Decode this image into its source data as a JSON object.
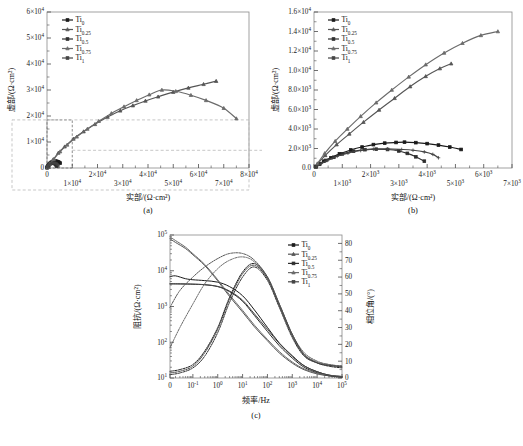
{
  "figure": {
    "panels": [
      {
        "id": "a",
        "caption": "(a)"
      },
      {
        "id": "b",
        "caption": "(b)"
      },
      {
        "id": "c",
        "caption": "(c)"
      }
    ]
  },
  "legend": {
    "entries": [
      {
        "base": "Ti",
        "sub": "0",
        "color": "#1a1a1a"
      },
      {
        "base": "Ti",
        "sub": "0.25",
        "color": "#555555"
      },
      {
        "base": "Ti",
        "sub": "0.5",
        "color": "#2e2e2e"
      },
      {
        "base": "Ti",
        "sub": "0.75",
        "color": "#6b6b6b"
      },
      {
        "base": "Ti",
        "sub": "1",
        "color": "#444444"
      }
    ]
  },
  "chart_data": [
    {
      "type": "scatter",
      "panel": "a",
      "title": "",
      "caption": "(a)",
      "xlabel": "实部/(Ω·cm²)",
      "ylabel": "虚部/(Ω·cm²)",
      "xlim": [
        0,
        80000
      ],
      "ylim": [
        0,
        60000
      ],
      "xticklabels": [
        "0",
        "1×10⁴",
        "2×10⁴",
        "3×10⁴",
        "4×10⁴",
        "5×10⁴",
        "6×10⁴",
        "7×10⁴",
        "8×10⁴"
      ],
      "yticklabels": [
        "0",
        "1×10⁴",
        "2×10⁴",
        "3×10⁴",
        "4×10⁴",
        "5×10⁴",
        "6×10⁴"
      ],
      "grid": false,
      "legend_position": "top-left",
      "zoom_box": {
        "x0": 0,
        "x1": 10000,
        "y0": 0,
        "y1": 18500,
        "note": "dashed inset box magnified in panel (b)"
      },
      "series": [
        {
          "name": "Ti0",
          "color": "#1a1a1a",
          "marker": "square",
          "x": [
            60,
            180,
            350,
            600,
            900,
            1300,
            1700,
            2100,
            2500,
            2900,
            3200,
            3600,
            4000,
            4400,
            4800,
            5200
          ],
          "y": [
            120,
            380,
            700,
            1050,
            1450,
            1850,
            2150,
            2400,
            2550,
            2620,
            2650,
            2600,
            2500,
            2350,
            2150,
            1900
          ]
        },
        {
          "name": "Ti0.25",
          "color": "#555555",
          "marker": "tri",
          "x": [
            200,
            900,
            2400,
            4500,
            7000,
            10500,
            14500,
            19000,
            24000,
            29000,
            34000,
            39000,
            44000,
            50000,
            56000,
            62000,
            67000
          ],
          "y": [
            300,
            1300,
            3200,
            5800,
            8200,
            11200,
            14000,
            16800,
            19600,
            22000,
            24000,
            25800,
            27400,
            29200,
            30800,
            32200,
            33400
          ]
        },
        {
          "name": "Ti0.5",
          "color": "#2e2e2e",
          "marker": "square",
          "x": [
            80,
            200,
            420,
            700,
            1000,
            1400,
            1800,
            2200,
            2600,
            3000,
            3300,
            3600,
            3900
          ],
          "y": [
            150,
            420,
            780,
            1100,
            1450,
            1720,
            1880,
            1930,
            1900,
            1750,
            1500,
            1150,
            700
          ]
        },
        {
          "name": "Ti0.75",
          "color": "#6b6b6b",
          "marker": "tri",
          "x": [
            250,
            1100,
            2800,
            5200,
            8000,
            11800,
            16000,
            20500,
            25500,
            30500,
            35500,
            40500,
            45500,
            51000,
            57000,
            63000,
            70000,
            75000
          ],
          "y": [
            350,
            1500,
            3500,
            6300,
            8900,
            12000,
            15000,
            18000,
            21000,
            23600,
            26000,
            28200,
            30000,
            29500,
            28000,
            26000,
            23000,
            19000
          ]
        },
        {
          "name": "Ti1",
          "color": "#444444",
          "marker": "plus",
          "x": [
            90,
            260,
            500,
            820,
            1200,
            1650,
            2100,
            2600,
            3100,
            3500,
            3900,
            4200,
            4400
          ],
          "y": [
            160,
            450,
            830,
            1200,
            1520,
            1790,
            1930,
            1960,
            1900,
            1820,
            1650,
            1400,
            1050
          ]
        }
      ]
    },
    {
      "type": "scatter",
      "panel": "b",
      "title": "",
      "caption": "(b)",
      "xlabel": "实部/(Ω·cm²)",
      "ylabel": "虚部/(Ω·cm²)",
      "xlim": [
        0,
        7000
      ],
      "ylim": [
        0,
        16000
      ],
      "xticklabels": [
        "0",
        "1×10³",
        "2×10³",
        "3×10³",
        "4×10³",
        "5×10³",
        "6×10³",
        "7×10³"
      ],
      "yticklabels": [
        "0.0",
        "2.0×10³",
        "4.0×10³",
        "6.0×10³",
        "8.0×10³",
        "1.0×10⁴",
        "1.2×10⁴",
        "1.4×10⁴",
        "1.6×10⁴"
      ],
      "grid": false,
      "legend_position": "top-left",
      "series": [
        {
          "name": "Ti0",
          "color": "#1a1a1a",
          "marker": "square",
          "x": [
            60,
            180,
            350,
            600,
            900,
            1300,
            1700,
            2100,
            2500,
            2900,
            3200,
            3600,
            4000,
            4400,
            4800,
            5200
          ],
          "y": [
            120,
            380,
            700,
            1050,
            1450,
            1850,
            2150,
            2400,
            2550,
            2620,
            2650,
            2600,
            2500,
            2350,
            2150,
            1900
          ]
        },
        {
          "name": "Ti0.25",
          "color": "#555555",
          "marker": "tri",
          "x": [
            120,
            400,
            800,
            1250,
            1750,
            2300,
            2850,
            3400,
            3950,
            4450,
            4850
          ],
          "y": [
            400,
            1300,
            2400,
            3500,
            4700,
            5950,
            7150,
            8350,
            9400,
            10200,
            10700
          ]
        },
        {
          "name": "Ti0.5",
          "color": "#2e2e2e",
          "marker": "square",
          "x": [
            80,
            200,
            420,
            700,
            1000,
            1400,
            1800,
            2200,
            2600,
            3000,
            3300,
            3600,
            3900
          ],
          "y": [
            150,
            420,
            780,
            1100,
            1450,
            1720,
            1880,
            1930,
            1900,
            1750,
            1500,
            1150,
            700
          ]
        },
        {
          "name": "Ti0.75",
          "color": "#6b6b6b",
          "marker": "tri",
          "x": [
            120,
            380,
            750,
            1180,
            1650,
            2200,
            2750,
            3350,
            3950,
            4600,
            5250,
            5900,
            6500
          ],
          "y": [
            450,
            1500,
            2750,
            4000,
            5300,
            6700,
            8000,
            9350,
            10600,
            11800,
            12800,
            13600,
            14000
          ]
        },
        {
          "name": "Ti1",
          "color": "#444444",
          "marker": "plus",
          "x": [
            90,
            260,
            500,
            820,
            1200,
            1650,
            2100,
            2600,
            3100,
            3500,
            3900,
            4200,
            4400
          ],
          "y": [
            160,
            450,
            830,
            1200,
            1520,
            1790,
            1930,
            1960,
            1900,
            1820,
            1650,
            1400,
            1050
          ]
        }
      ]
    },
    {
      "type": "line",
      "panel": "c",
      "title": "",
      "caption": "(c)",
      "xlabel": "频率/Hz",
      "ylabel": "阻抗/(Ω·cm²)",
      "y2label": "相位角/(°)",
      "xscale": "log",
      "yscale": "log",
      "xlim": [
        0.01,
        100000
      ],
      "ylim": [
        10,
        100000
      ],
      "y2lim": [
        0,
        85
      ],
      "xticklabels": [
        "0",
        "10⁻¹",
        "10⁰",
        "10¹",
        "10²",
        "10³",
        "10⁴",
        "10⁵"
      ],
      "yticklabels": [
        "10¹",
        "10²",
        "10³",
        "10⁴",
        "10⁵"
      ],
      "y2ticklabels": [
        "0",
        "10",
        "20",
        "30",
        "40",
        "50",
        "60",
        "70",
        "80"
      ],
      "grid": false,
      "legend_position": "top-right",
      "modulus_series": [
        {
          "name": "Ti0",
          "color": "#1a1a1a",
          "x": [
            0.01,
            0.02,
            0.05,
            0.1,
            0.3,
            1,
            3,
            10,
            30,
            100,
            300,
            1000,
            3000,
            10000,
            30000,
            100000
          ],
          "y": [
            6800,
            7200,
            6000,
            5600,
            5300,
            4800,
            3600,
            2000,
            800,
            260,
            95,
            42,
            22,
            15,
            12,
            11
          ]
        },
        {
          "name": "Ti0.25",
          "color": "#555555",
          "x": [
            0.01,
            0.02,
            0.05,
            0.1,
            0.3,
            1,
            3,
            10,
            30,
            100,
            300,
            1000,
            3000,
            10000,
            30000,
            100000
          ],
          "y": [
            78000,
            62000,
            42000,
            28000,
            14000,
            5200,
            1900,
            700,
            270,
            110,
            50,
            26,
            17,
            13,
            11.5,
            11
          ]
        },
        {
          "name": "Ti0.5",
          "color": "#2e2e2e",
          "x": [
            0.01,
            0.02,
            0.05,
            0.1,
            0.3,
            1,
            3,
            10,
            30,
            100,
            300,
            1000,
            3000,
            10000,
            30000,
            100000
          ],
          "y": [
            4300,
            4300,
            4250,
            4200,
            4050,
            3600,
            2600,
            1400,
            560,
            200,
            80,
            36,
            20,
            14,
            11.5,
            10.5
          ]
        },
        {
          "name": "Ti0.75",
          "color": "#6b6b6b",
          "x": [
            0.01,
            0.02,
            0.05,
            0.1,
            0.3,
            1,
            3,
            10,
            30,
            100,
            300,
            1000,
            3000,
            10000,
            30000,
            100000
          ],
          "y": [
            88000,
            70000,
            46000,
            30000,
            15000,
            5600,
            2100,
            780,
            300,
            120,
            55,
            28,
            18,
            13.5,
            12,
            11
          ]
        },
        {
          "name": "Ti1",
          "color": "#444444",
          "x": [
            0.01,
            0.02,
            0.05,
            0.1,
            0.3,
            1,
            3,
            10,
            30,
            100,
            300,
            1000,
            3000,
            10000,
            30000,
            100000
          ],
          "y": [
            4300,
            4300,
            4280,
            4230,
            4080,
            3650,
            2700,
            1500,
            620,
            230,
            92,
            40,
            22,
            15,
            12,
            10.5
          ]
        }
      ],
      "phase_series": [
        {
          "name": "Ti0",
          "color": "#1a1a1a",
          "x": [
            0.01,
            0.03,
            0.1,
            0.3,
            1,
            3,
            10,
            30,
            100,
            300,
            1000,
            3000,
            10000,
            30000,
            100000
          ],
          "y": [
            4,
            5,
            8,
            16,
            30,
            48,
            63,
            68,
            60,
            44,
            26,
            14,
            9,
            7,
            6
          ]
        },
        {
          "name": "Ti0.25",
          "color": "#555555",
          "x": [
            0.01,
            0.03,
            0.1,
            0.3,
            1,
            3,
            10,
            30,
            100,
            300,
            1000,
            3000,
            10000,
            30000,
            100000
          ],
          "y": [
            42,
            52,
            60,
            66,
            71,
            74,
            74,
            70,
            60,
            44,
            26,
            15,
            10,
            8,
            7
          ]
        },
        {
          "name": "Ti0.5",
          "color": "#2e2e2e",
          "x": [
            0.01,
            0.03,
            0.1,
            0.3,
            1,
            3,
            10,
            30,
            100,
            300,
            1000,
            3000,
            10000,
            30000,
            100000
          ],
          "y": [
            2,
            3,
            6,
            13,
            27,
            45,
            60,
            66,
            58,
            42,
            24,
            13,
            9,
            7.5,
            7
          ]
        },
        {
          "name": "Ti0.75",
          "color": "#6b6b6b",
          "x": [
            0.01,
            0.03,
            0.1,
            0.3,
            1,
            3,
            10,
            30,
            100,
            300,
            1000,
            3000,
            10000,
            30000,
            100000
          ],
          "y": [
            18,
            30,
            44,
            56,
            65,
            70,
            72,
            69,
            59,
            43,
            25,
            14,
            9.5,
            8,
            7
          ]
        },
        {
          "name": "Ti1",
          "color": "#444444",
          "x": [
            0.01,
            0.03,
            0.1,
            0.3,
            1,
            3,
            10,
            30,
            100,
            300,
            1000,
            3000,
            10000,
            30000,
            100000
          ],
          "y": [
            3,
            4,
            7,
            15,
            29,
            47,
            62,
            67,
            59,
            43,
            25,
            13.5,
            9,
            7.5,
            6.5
          ]
        }
      ]
    }
  ]
}
